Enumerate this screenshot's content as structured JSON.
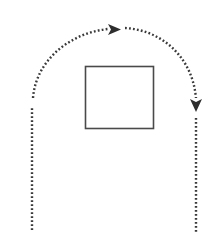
{
  "diagram": {
    "width": 217,
    "height": 244,
    "background": "#ffffff",
    "stroke_color": "#3a3a3a",
    "obstacle": {
      "shape": "square",
      "x": 85,
      "y": 66,
      "width": 69,
      "height": 63,
      "stroke": "#4a4a4a",
      "fill": "#ffffff"
    },
    "path": {
      "style": "dotted",
      "segments": [
        {
          "name": "left-vertical",
          "from": [
            32,
            230
          ],
          "to": [
            32,
            108
          ]
        },
        {
          "name": "left-arc",
          "from": [
            33,
            98
          ],
          "to": [
            110,
            29
          ]
        },
        {
          "name": "top-right-arc",
          "from": [
            125,
            28
          ],
          "to": [
            196,
            98
          ]
        },
        {
          "name": "right-vertical",
          "from": [
            196,
            118
          ],
          "to": [
            196,
            233
          ]
        }
      ],
      "arrowheads": [
        {
          "name": "arrow-right",
          "at": [
            116,
            30
          ],
          "direction": "right"
        },
        {
          "name": "arrow-down",
          "at": [
            196,
            108
          ],
          "direction": "down"
        }
      ]
    }
  }
}
